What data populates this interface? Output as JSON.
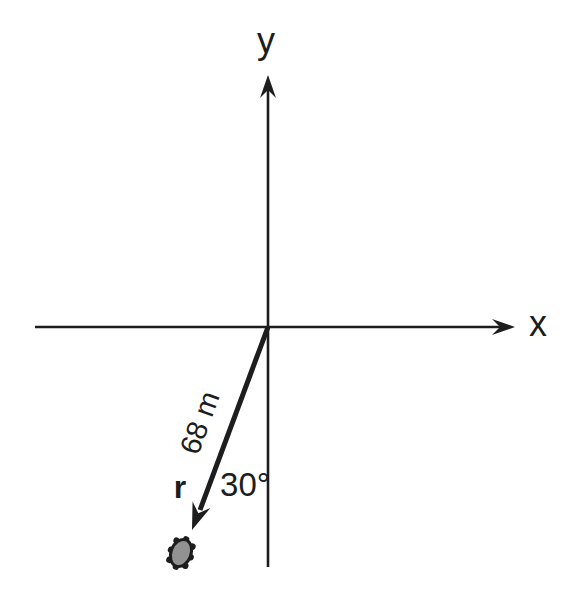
{
  "diagram": {
    "axes": {
      "x_label": "x",
      "y_label": "y"
    },
    "vector": {
      "label": "r",
      "length_label": "68 m",
      "angle_label": "30°",
      "length_value_m": 68,
      "angle_value_deg": 30
    },
    "colors": {
      "ink": "#1d1d1d",
      "bug_fill": "#929292",
      "background": "#ffffff"
    }
  }
}
